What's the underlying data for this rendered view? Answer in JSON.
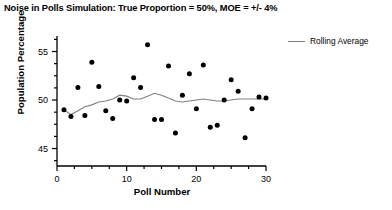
{
  "chart_data": {
    "type": "scatter",
    "title": "Noise in Polls Simulation: True Proportion = 50%, MOE = +/- 4%",
    "xlabel": "Poll Number",
    "ylabel": "Population Percentage",
    "xlim": [
      0,
      30
    ],
    "ylim": [
      43.2,
      56.6
    ],
    "xticks": [
      0,
      10,
      20,
      30
    ],
    "yticks": [
      45,
      50,
      55
    ],
    "xminor_step": 2.5,
    "yminor_step": 1.25,
    "grid": false,
    "legend_position": "top-right",
    "marker_color": "#000000",
    "line_color": "#808080",
    "series": [
      {
        "name": "Poll Result",
        "type": "scatter",
        "x": [
          1,
          2,
          3,
          4,
          5,
          6,
          7,
          8,
          9,
          10,
          11,
          12,
          13,
          14,
          15,
          16,
          17,
          18,
          19,
          20,
          21,
          22,
          23,
          24,
          25,
          26,
          27,
          28,
          29,
          30
        ],
        "y": [
          49.0,
          48.3,
          51.3,
          48.4,
          53.9,
          51.4,
          48.9,
          48.1,
          50.0,
          49.9,
          52.3,
          51.3,
          55.7,
          48.0,
          48.0,
          53.5,
          46.6,
          50.5,
          52.7,
          49.1,
          53.6,
          47.2,
          47.4,
          50.0,
          52.1,
          50.9,
          46.1,
          49.1,
          50.3,
          50.2
        ]
      },
      {
        "name": "Rolling Average",
        "type": "line",
        "x": [
          1,
          2,
          3,
          4,
          5,
          6,
          7,
          8,
          9,
          10,
          11,
          12,
          13,
          14,
          15,
          16,
          17,
          18,
          19,
          20,
          21,
          22,
          23,
          24,
          25,
          26,
          27,
          28,
          29,
          30
        ],
        "y": [
          49.0,
          48.5,
          48.9,
          49.3,
          49.5,
          49.8,
          49.9,
          50.1,
          50.5,
          50.4,
          50.1,
          50.1,
          50.4,
          50.7,
          50.5,
          50.2,
          49.9,
          49.8,
          49.9,
          50.0,
          50.1,
          50.0,
          49.9,
          49.9,
          50.0,
          50.1,
          50.1,
          50.1,
          50.1,
          50.1
        ]
      }
    ],
    "legend": [
      {
        "label": "Rolling Average"
      }
    ]
  },
  "axes": {
    "xtick_labels": [
      "0",
      "10",
      "20",
      "30"
    ],
    "ytick_labels": [
      "45",
      "50",
      "55"
    ]
  }
}
